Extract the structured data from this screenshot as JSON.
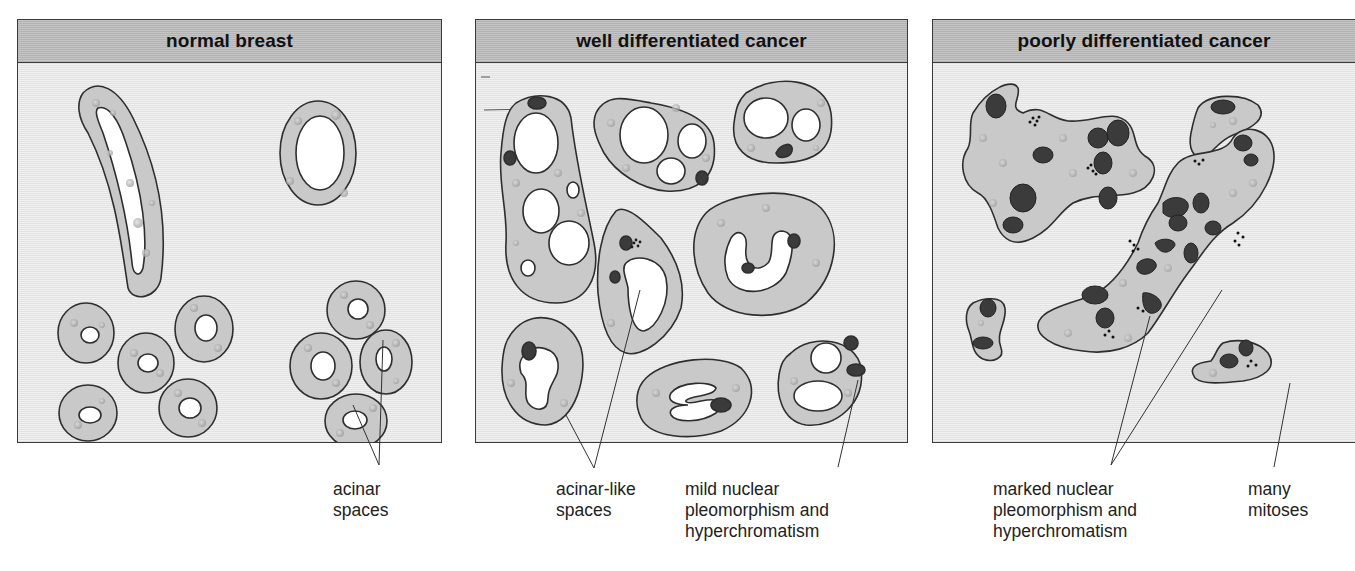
{
  "figure": {
    "panels": [
      {
        "title": "normal breast"
      },
      {
        "title": "well differentiated cancer"
      },
      {
        "title": "poorly differentiated cancer"
      }
    ],
    "annotations": [
      {
        "text": "acinar\nspaces"
      },
      {
        "text": "acinar-like\nspaces"
      },
      {
        "text": "mild nuclear\npleomorphism and\nhyperchromatism"
      },
      {
        "text": "marked nuclear\npleomorphism and\nhyperchromatism"
      },
      {
        "text": "many\nmitoses"
      }
    ]
  },
  "colors": {
    "cytoplasm": "#c9c9c9",
    "outline": "#2e2e2e",
    "nucleus": "#3b3b3b",
    "lumen": "#ffffff",
    "panel_bg": "#e9e9e9",
    "header_bg": "#bdbdbd"
  }
}
